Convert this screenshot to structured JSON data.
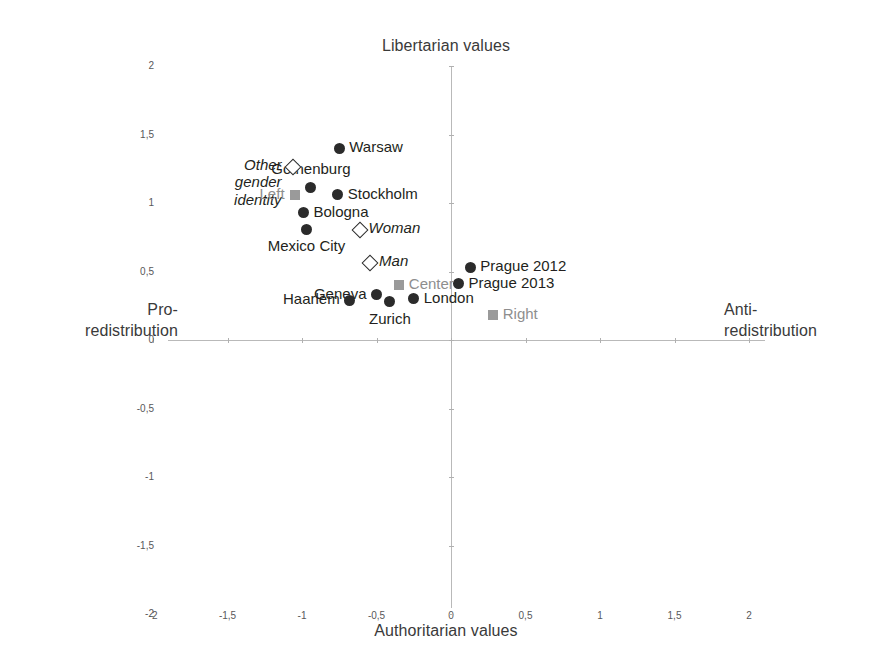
{
  "chart_data": {
    "type": "scatter",
    "title": "",
    "xlabel": "Authoritarian values",
    "ylabel": "Libertarian values",
    "axis_end_labels": {
      "left": "Pro-\nredistribution",
      "right": "Anti-\nredistribution",
      "top": "Libertarian values",
      "bottom": "Authoritarian values"
    },
    "xlim": [
      -2,
      2
    ],
    "ylim": [
      -2,
      2
    ],
    "grid": false,
    "legend": "none",
    "xticks": [
      "-2",
      "-1,5",
      "-1",
      "-0,5",
      "0",
      "0,5",
      "1",
      "1,5",
      "2"
    ],
    "xtick_values": [
      -2,
      -1.5,
      -1,
      -0.5,
      0,
      0.5,
      1,
      1.5,
      2
    ],
    "yticks": [
      "2",
      "1,5",
      "1",
      "0,5",
      "0",
      "-0,5",
      "-1",
      "-1,5",
      "-2"
    ],
    "ytick_values": [
      2,
      1.5,
      1,
      0.5,
      0,
      -0.5,
      -1,
      -1.5,
      -2
    ],
    "series": [
      {
        "name": "Cities",
        "marker": "filled-circle",
        "color": "#2b2b2b",
        "points": [
          {
            "label": "Warsaw",
            "x": -0.75,
            "y": 1.4,
            "label_pos": "right"
          },
          {
            "label": "Gothenburg",
            "x": -0.94,
            "y": 1.11,
            "label_pos": "above"
          },
          {
            "label": "Stockholm",
            "x": -0.76,
            "y": 1.06,
            "label_pos": "right"
          },
          {
            "label": "Bologna",
            "x": -0.99,
            "y": 0.93,
            "label_pos": "right"
          },
          {
            "label": "Mexico City",
            "x": -0.97,
            "y": 0.81,
            "label_pos": "below-left"
          },
          {
            "label": "Prague 2012",
            "x": 0.13,
            "y": 0.53,
            "label_pos": "right"
          },
          {
            "label": "Prague 2013",
            "x": 0.05,
            "y": 0.41,
            "label_pos": "right"
          },
          {
            "label": "Geneva",
            "x": -0.5,
            "y": 0.33,
            "label_pos": "left"
          },
          {
            "label": "Haarlem",
            "x": -0.68,
            "y": 0.29,
            "label_pos": "left"
          },
          {
            "label": "Zurich",
            "x": -0.41,
            "y": 0.28,
            "label_pos": "below"
          },
          {
            "label": "London",
            "x": -0.25,
            "y": 0.3,
            "label_pos": "right"
          }
        ]
      },
      {
        "name": "Gender",
        "marker": "open-diamond",
        "color": "#2b2b2b",
        "points": [
          {
            "label": "Other\ngender\nidentity",
            "x": -1.07,
            "y": 1.27,
            "label_pos": "left",
            "italic": true
          },
          {
            "label": "Woman",
            "x": -0.62,
            "y": 0.81,
            "label_pos": "right",
            "italic": true
          },
          {
            "label": "Man",
            "x": -0.55,
            "y": 0.57,
            "label_pos": "right",
            "italic": true
          }
        ]
      },
      {
        "name": "Political self-placement",
        "marker": "filled-square",
        "color": "#9a9a9a",
        "points": [
          {
            "label": "Left",
            "x": -1.05,
            "y": 1.06,
            "label_pos": "left",
            "gray": true
          },
          {
            "label": "Center",
            "x": -0.35,
            "y": 0.4,
            "label_pos": "right",
            "gray": true
          },
          {
            "label": "Right",
            "x": 0.28,
            "y": 0.18,
            "label_pos": "right",
            "gray": true
          }
        ]
      }
    ]
  }
}
